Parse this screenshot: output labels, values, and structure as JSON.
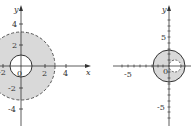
{
  "left_plot": {
    "x_axis_label": "x",
    "y_axis_label": "y",
    "x_ticks": [
      "-2",
      "0",
      "2",
      "4"
    ],
    "y_ticks": [
      "4",
      "2",
      "-2",
      "-4"
    ],
    "outer_region": {
      "shape": "circle",
      "radius": 3,
      "boundary": "dashed"
    },
    "inner_hole": {
      "shape": "circle",
      "radius": 1,
      "boundary": "solid"
    },
    "shading_color": "#d9d9d9"
  },
  "right_plot": {
    "x_axis_label": "x",
    "y_axis_label": "y",
    "x_ticks": [
      "-5",
      "0"
    ],
    "y_ticks": [
      "5",
      "-5"
    ],
    "outer_region": {
      "shape": "circle",
      "radius": 3,
      "boundary": "solid"
    },
    "inner_hole": {
      "shape": "circle",
      "center": [
        1,
        0
      ],
      "radius": 1,
      "boundary": "dashed"
    },
    "shading_color": "#d9d9d9"
  }
}
